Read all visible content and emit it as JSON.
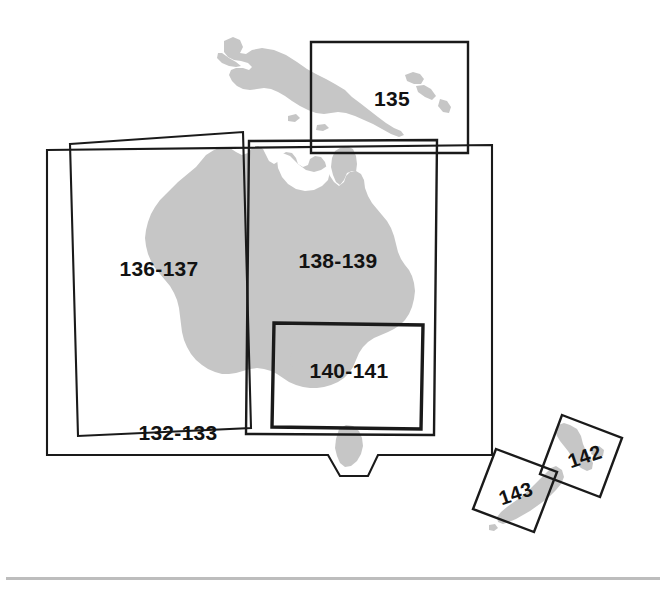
{
  "figure": {
    "kind": "map-index-key",
    "region_name": "Australia, New Guinea and New Zealand",
    "background_color": "#ffffff",
    "land_color": "#c6c6c6",
    "box_line_color": "#1a1a1a",
    "footer_rule_color": "#bdbdbd"
  },
  "landmasses": [
    {
      "id": "new-guinea",
      "name": "New Guinea"
    },
    {
      "id": "australia",
      "name": "Australia"
    },
    {
      "id": "tasmania",
      "name": "Tasmania"
    },
    {
      "id": "new-zealand-north",
      "name": "New Zealand North Island"
    },
    {
      "id": "new-zealand-south",
      "name": "New Zealand South Island"
    },
    {
      "id": "islands-small",
      "name": "Small Islands"
    }
  ],
  "index_boxes": [
    {
      "id": "box-135",
      "label": "135",
      "covers": "New Guinea",
      "label_x": 392,
      "label_y": 106,
      "stroke": "med"
    },
    {
      "id": "box-132-133",
      "label": "132-133",
      "covers": "Australia overview",
      "label_x": 178,
      "label_y": 440,
      "stroke": "thin"
    },
    {
      "id": "box-136-137",
      "label": "136-137",
      "covers": "Western Australia",
      "label_x": 159,
      "label_y": 276,
      "stroke": "thin"
    },
    {
      "id": "box-138-139",
      "label": "138-139",
      "covers": "Eastern Australia",
      "label_x": 338,
      "label_y": 268,
      "stroke": "med"
    },
    {
      "id": "box-140-141",
      "label": "140-141",
      "covers": "South-eastern Australia",
      "label_x": 349,
      "label_y": 378,
      "stroke": "thick"
    },
    {
      "id": "box-142",
      "label": "142",
      "covers": "New Zealand North Island",
      "label_x": 587,
      "label_y": 463,
      "stroke": "med"
    },
    {
      "id": "box-143",
      "label": "143",
      "covers": "New Zealand South Island",
      "label_x": 518,
      "label_y": 500,
      "stroke": "med"
    }
  ]
}
